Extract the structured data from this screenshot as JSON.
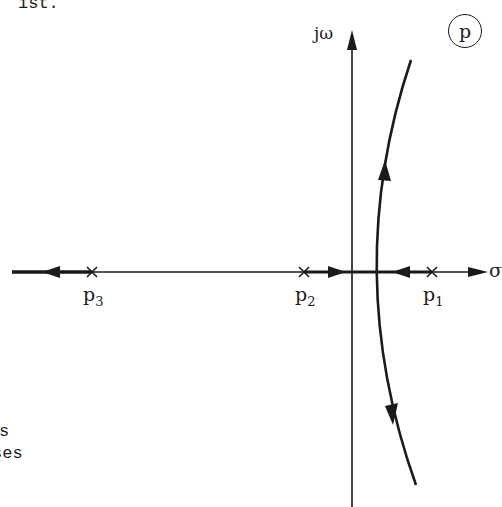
{
  "text_fragments": {
    "top": "ist.",
    "bottom_line1": "s",
    "bottom_line2": "ses"
  },
  "diagram": {
    "type": "root-locus",
    "plane_label": "p",
    "axes": {
      "imaginary_label": "jω",
      "real_label": "σ"
    },
    "poles": [
      {
        "name": "p",
        "index": "1"
      },
      {
        "name": "p",
        "index": "2"
      },
      {
        "name": "p",
        "index": "3"
      }
    ],
    "colors": {
      "ink": "#1a1a1a",
      "background": "#ffffff"
    }
  }
}
